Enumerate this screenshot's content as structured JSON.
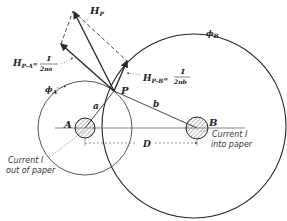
{
  "diagram": {
    "labels": {
      "hp": "H",
      "hp_sub": "P",
      "hpa": "H",
      "hpa_sub": "P-A",
      "hpa_eq": "=",
      "hpa_num": "I",
      "hpa_den": "2πa",
      "hpb": "H",
      "hpb_sub": "P-B",
      "hpb_eq": "=",
      "hpb_num": "I",
      "hpb_den": "2πb",
      "phi_a": "ϕ",
      "phi_a_sub": "A",
      "phi_b": "ϕ",
      "phi_b_sub": "B",
      "point_p": "P",
      "point_a": "A",
      "point_b": "B",
      "dist_a": "a",
      "dist_b": "b",
      "dist_d": "D",
      "current_a_line1": "Current I",
      "current_a_line2": "out of paper",
      "current_b_line1": "Current I",
      "current_b_line2": "into paper"
    },
    "colors": {
      "line": "#2a2a2a",
      "hatch": "#777777"
    }
  }
}
